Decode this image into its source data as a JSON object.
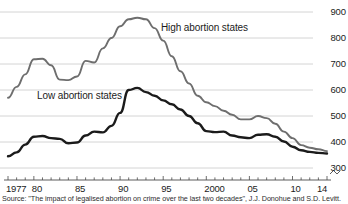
{
  "chart_data": {
    "type": "line",
    "title": "",
    "subtitle": "",
    "xlabel": "",
    "ylabel": "",
    "ylim": [
      300,
      900
    ],
    "xlim": [
      1977,
      2014
    ],
    "grid": true,
    "grid_axis": "y",
    "legend": "inline-annotations",
    "y_axis_position": "right",
    "y_ticks": [
      900,
      800,
      700,
      600,
      500,
      400,
      300
    ],
    "y_tick_labels": [
      "900",
      "800",
      "700",
      "600",
      "500",
      "400",
      "300"
    ],
    "x_ticks": [
      1977,
      1980,
      1985,
      1990,
      1995,
      2000,
      2005,
      2010,
      2014
    ],
    "x_tick_labels": [
      "1977",
      "80",
      "85",
      "90",
      "95",
      "2000",
      "05",
      "10",
      "14"
    ],
    "x_minor_ticks_every_year": true,
    "axis_break_marker": true,
    "x": [
      1977,
      1978,
      1979,
      1980,
      1981,
      1982,
      1983,
      1984,
      1985,
      1986,
      1987,
      1988,
      1989,
      1990,
      1991,
      1992,
      1993,
      1994,
      1995,
      1996,
      1997,
      1998,
      1999,
      2000,
      2001,
      2002,
      2003,
      2004,
      2005,
      2006,
      2007,
      2008,
      2009,
      2010,
      2011,
      2012,
      2013,
      2014
    ],
    "series": [
      {
        "name": "High abortion states",
        "color": "#6e6e6e",
        "values": [
          570,
          612,
          660,
          718,
          720,
          695,
          640,
          638,
          652,
          712,
          706,
          760,
          800,
          845,
          872,
          878,
          872,
          838,
          790,
          730,
          672,
          625,
          578,
          553,
          538,
          520,
          505,
          487,
          487,
          500,
          492,
          470,
          440,
          415,
          388,
          378,
          372,
          365
        ]
      },
      {
        "name": "Low abortion states",
        "color": "#1b1b1b",
        "values": [
          345,
          360,
          390,
          420,
          423,
          415,
          412,
          395,
          398,
          425,
          440,
          437,
          462,
          512,
          600,
          608,
          592,
          578,
          560,
          545,
          525,
          500,
          472,
          442,
          438,
          440,
          425,
          418,
          415,
          428,
          430,
          420,
          402,
          382,
          368,
          362,
          358,
          356
        ]
      }
    ]
  },
  "annotations": {
    "high_label": "High abortion states",
    "low_label": "Low abortion states"
  },
  "source": {
    "text": "Source: \"The impact of legalised abortion on crime over the last two decades\", J.J. Donohue and S.D. Levitt."
  }
}
